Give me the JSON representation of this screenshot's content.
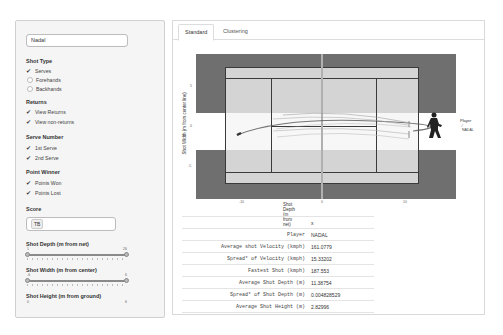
{
  "sidebar": {
    "player_input": {
      "value": "Nadal"
    },
    "shot_type": {
      "label": "Shot Type",
      "options": [
        {
          "label": "Serves",
          "checked": true
        },
        {
          "label": "Forehands",
          "checked": false
        },
        {
          "label": "Backhands",
          "checked": false
        }
      ]
    },
    "returns": {
      "label": "Returns",
      "options": [
        {
          "label": "View Returns",
          "checked": true
        },
        {
          "label": "View non-returns",
          "checked": true
        }
      ]
    },
    "serve_number": {
      "label": "Serve Number",
      "options": [
        {
          "label": "1st Serve",
          "checked": true
        },
        {
          "label": "2nd Serve",
          "checked": true
        }
      ]
    },
    "point_winner": {
      "label": "Point Winner",
      "options": [
        {
          "label": "Points Won",
          "checked": true
        },
        {
          "label": "Points Lost",
          "checked": true
        }
      ]
    },
    "score": {
      "label": "Score",
      "value": "TB"
    },
    "shot_depth": {
      "label": "Shot Depth (m from net)",
      "min": "1",
      "max": "26"
    },
    "shot_width": {
      "label": "Shot Width (m from center)",
      "min": "-6",
      "max": "6"
    },
    "shot_height": {
      "label": "Shot Height (m from ground)",
      "min": "0",
      "max": "6"
    }
  },
  "tabs": [
    {
      "label": "Standard",
      "active": true
    },
    {
      "label": "Clustering",
      "active": false
    }
  ],
  "plot": {
    "xlabel": "Shot Depth (m from net)",
    "ylabel": "Shot Width (m from center line)",
    "x_ticks": [
      "-10",
      "0",
      "10"
    ],
    "y_ticks": [
      "5",
      "0",
      "-5"
    ],
    "legend_title": "Player",
    "legend_entry": "NADAL",
    "colors": {
      "surround": "#6f6f6f",
      "court": "#d4d4d4",
      "lines": "#3a3a3a",
      "net": "#b0b0b0"
    }
  },
  "stats_table": {
    "header": "x",
    "rows": [
      {
        "key": "Player",
        "value": "NADAL"
      },
      {
        "key": "Average shot Velocity (kmph)",
        "value": "161.0779"
      },
      {
        "key": "Spread* of Velocity (kmph)",
        "value": "15.33202"
      },
      {
        "key": "Fastest Shot (kmph)",
        "value": "187.553"
      },
      {
        "key": "Average Shot Depth (m)",
        "value": "11.38754"
      },
      {
        "key": "Spread* of Shot Depth (m)",
        "value": "0.004828529"
      },
      {
        "key": "Average Shot Height (m)",
        "value": "2.82996"
      }
    ]
  }
}
